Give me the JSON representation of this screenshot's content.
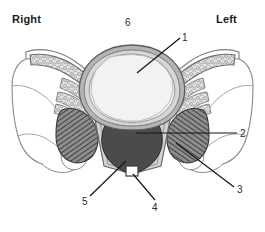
{
  "figure": {
    "background_color": "#ffffff",
    "width": 265,
    "height": 232,
    "orientation_labels": {
      "right": "Right",
      "left": "Left"
    },
    "numbered_labels": [
      {
        "id": "1",
        "text": "1",
        "x": 182,
        "y": 32
      },
      {
        "id": "2",
        "text": "2",
        "x": 240,
        "y": 128
      },
      {
        "id": "3",
        "text": "3",
        "x": 237,
        "y": 184
      },
      {
        "id": "4",
        "text": "4",
        "x": 152,
        "y": 202
      },
      {
        "id": "5",
        "text": "5",
        "x": 82,
        "y": 196
      },
      {
        "id": "6",
        "text": "6",
        "x": 125,
        "y": 17
      }
    ],
    "colors": {
      "outline": "#4a4a4a",
      "thin_outline": "#8a8a8a",
      "cortical_rim": "#9a9a9a",
      "vertebral_body_fill": "#ececec",
      "dark_mass_fill": "#4b4b4b",
      "hatched_muscle_fill": "#6e6e6e",
      "cancellous_fill": "#d8d8d8",
      "leader_line": "#1a1a1a",
      "text": "#1a1a1a"
    }
  }
}
